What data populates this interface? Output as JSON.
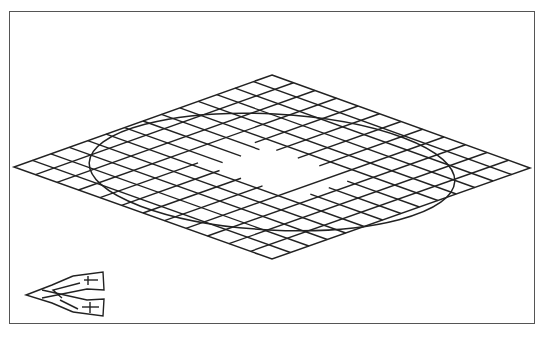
{
  "figure": {
    "type": "isometric hatched rhombus with inscribed ellipse",
    "frame": {
      "x": 9,
      "y": 11,
      "width": 526,
      "height": 313
    },
    "rhombus": {
      "top": [
        272,
        75
      ],
      "right": [
        530,
        168
      ],
      "bottom": [
        272,
        259
      ],
      "left": [
        14,
        167
      ]
    },
    "ellipse": {
      "cx": 272,
      "cy": 172,
      "rx": 183,
      "ry": 58,
      "rotate": 3
    },
    "hatch": {
      "family_a_count": 14,
      "family_b_count": 12,
      "hole": true
    },
    "axis_indicator": {
      "position": "bottom-left"
    },
    "colors": {
      "stroke": "#222222",
      "frame": "#555555",
      "background": "#ffffff"
    }
  }
}
